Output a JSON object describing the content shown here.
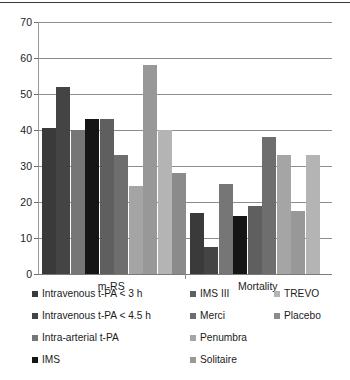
{
  "chart_data": {
    "type": "bar",
    "title": "",
    "xlabel": "",
    "ylabel": "",
    "ylim": [
      0,
      70
    ],
    "yticks": [
      0,
      10,
      20,
      30,
      40,
      50,
      60,
      70
    ],
    "ytick_labels": [
      "0",
      "10",
      "20",
      "30",
      "40",
      "50",
      "60",
      "70"
    ],
    "grid": true,
    "legend_position": "bottom",
    "categories": [
      "m-RS",
      "Mortality"
    ],
    "series": [
      {
        "name": "Intravenous t-PA < 3 h",
        "color": "#3a3a3a",
        "values": [
          40.5,
          17.0
        ]
      },
      {
        "name": "Intravenous t-PA < 4.5 h",
        "color": "#444444",
        "values": [
          52.0,
          7.5
        ]
      },
      {
        "name": "Intra-arterial t-PA",
        "color": "#767676",
        "values": [
          40.0,
          25.0
        ]
      },
      {
        "name": "IMS",
        "color": "#151515",
        "values": [
          43.0,
          16.0
        ]
      },
      {
        "name": "IMS III",
        "color": "#5f5f5f",
        "values": [
          43.0,
          19.0
        ]
      },
      {
        "name": "Merci",
        "color": "#6e6e6e",
        "values": [
          33.0,
          38.0
        ]
      },
      {
        "name": "Penumbra",
        "color": "#a5a5a5",
        "values": [
          24.5,
          33.0
        ]
      },
      {
        "name": "Solitaire",
        "color": "#989898",
        "values": [
          58.0,
          17.5
        ]
      },
      {
        "name": "TREVO",
        "color": "#b4b4b4",
        "values": [
          40.0,
          33.0
        ]
      },
      {
        "name": "Placebo",
        "color": "#8b8b8b",
        "values": [
          28.0,
          null
        ]
      }
    ]
  },
  "legend": {
    "col1": [
      {
        "label": "Intravenous t-PA < 3 h",
        "color": "#3a3a3a"
      },
      {
        "label": "Intravenous t-PA < 4.5 h",
        "color": "#444444"
      },
      {
        "label": "Intra-arterial t-PA",
        "color": "#767676"
      },
      {
        "label": "IMS",
        "color": "#151515"
      }
    ],
    "col2": [
      {
        "label": "IMS III",
        "color": "#5f5f5f"
      },
      {
        "label": "Merci",
        "color": "#6e6e6e"
      },
      {
        "label": "Penumbra",
        "color": "#a5a5a5"
      },
      {
        "label": "Solitaire",
        "color": "#989898"
      }
    ],
    "col3": [
      {
        "label": "TREVO",
        "color": "#b4b4b4"
      },
      {
        "label": "Placebo",
        "color": "#8b8b8b"
      }
    ]
  }
}
